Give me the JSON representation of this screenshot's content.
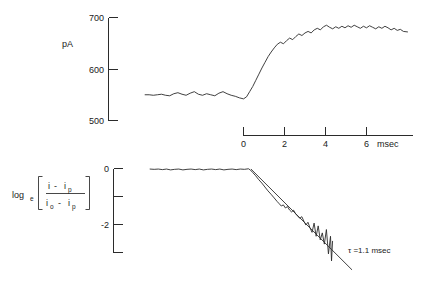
{
  "figure": {
    "background": "#ffffff",
    "ink_color": "#2b2b2b"
  },
  "chart_data": [
    {
      "type": "line",
      "id": "current-vs-time",
      "title": "",
      "xlabel": "msec",
      "ylabel": "pA",
      "xlim": [
        -4.8,
        8.2
      ],
      "ylim": [
        480,
        712
      ],
      "grid": false,
      "legend": null,
      "axis_ticks": {
        "y": [
          500,
          600,
          700
        ],
        "y_labels": [
          "500",
          "600",
          "700"
        ],
        "x": [
          0,
          2,
          4,
          6
        ],
        "x_labels": [
          "0",
          "2",
          "4",
          "6"
        ],
        "x_unit_label": "msec"
      },
      "series": [
        {
          "name": "membrane current",
          "x": [
            -4.8,
            -4.6,
            -4.4,
            -4.2,
            -4.0,
            -3.8,
            -3.6,
            -3.4,
            -3.2,
            -3.0,
            -2.8,
            -2.6,
            -2.4,
            -2.2,
            -2.0,
            -1.8,
            -1.6,
            -1.4,
            -1.2,
            -1.0,
            -0.8,
            -0.6,
            -0.4,
            -0.2,
            0.0,
            0.15,
            0.3,
            0.45,
            0.6,
            0.75,
            0.9,
            1.05,
            1.2,
            1.35,
            1.5,
            1.65,
            1.8,
            1.95,
            2.1,
            2.25,
            2.4,
            2.55,
            2.7,
            2.85,
            3.0,
            3.15,
            3.3,
            3.45,
            3.6,
            3.75,
            3.9,
            4.05,
            4.2,
            4.35,
            4.5,
            4.65,
            4.8,
            4.95,
            5.1,
            5.25,
            5.4,
            5.55,
            5.7,
            5.85,
            6.0,
            6.15,
            6.3,
            6.45,
            6.6,
            6.75,
            6.9,
            7.05,
            7.2,
            7.35,
            7.5,
            7.65,
            7.8,
            8.0
          ],
          "y": [
            550,
            550,
            549,
            550,
            551,
            549,
            548,
            552,
            554,
            551,
            549,
            553,
            556,
            551,
            549,
            552,
            550,
            548,
            553,
            556,
            552,
            549,
            547,
            544,
            542,
            546,
            556,
            566,
            578,
            590,
            602,
            613,
            624,
            633,
            641,
            648,
            652,
            649,
            655,
            660,
            657,
            663,
            668,
            665,
            670,
            673,
            670,
            676,
            679,
            676,
            682,
            685,
            681,
            678,
            682,
            679,
            683,
            680,
            684,
            681,
            685,
            682,
            679,
            683,
            680,
            684,
            681,
            678,
            682,
            679,
            683,
            680,
            676,
            679,
            675,
            677,
            673,
            672
          ]
        }
      ]
    },
    {
      "type": "line",
      "id": "semilog-decay",
      "title": "",
      "xlabel": "",
      "ylabel": "log_e[(i - i_p)/(i_o - i_p)]",
      "xlim": [
        -4.8,
        8.2
      ],
      "ylim": [
        -3.9,
        0.35
      ],
      "grid": false,
      "legend": null,
      "axis_ticks": {
        "y": [
          0,
          -1,
          -2,
          -3
        ],
        "y_labels": [
          "0",
          "",
          "-2",
          ""
        ]
      },
      "annotations": [
        {
          "text": "τ =1.1 msec",
          "x": 5.1,
          "y": -2.55
        }
      ],
      "series": [
        {
          "name": "log transformed current",
          "x": [
            -4.8,
            -4.6,
            -4.4,
            -4.2,
            -4.0,
            -3.8,
            -3.6,
            -3.4,
            -3.2,
            -3.0,
            -2.8,
            -2.6,
            -2.4,
            -2.2,
            -2.0,
            -1.8,
            -1.6,
            -1.4,
            -1.2,
            -1.0,
            -0.8,
            -0.6,
            -0.4,
            -0.2,
            0.0,
            0.1,
            0.2,
            0.35,
            0.5,
            0.65,
            0.8,
            0.95,
            1.1,
            1.25,
            1.4,
            1.5,
            1.6,
            1.7,
            1.8,
            1.9,
            2.0,
            2.1,
            2.2,
            2.3,
            2.4,
            2.5,
            2.6,
            2.7,
            2.8,
            2.9,
            3.0,
            3.1,
            3.2,
            3.3,
            3.4,
            3.5,
            3.6,
            3.7,
            3.8,
            3.9,
            4.0,
            4.05,
            4.1
          ],
          "y": [
            -0.02,
            -0.03,
            -0.02,
            -0.04,
            -0.02,
            -0.05,
            -0.03,
            -0.02,
            -0.05,
            -0.03,
            -0.02,
            -0.04,
            -0.02,
            -0.05,
            -0.03,
            -0.02,
            -0.04,
            -0.02,
            -0.05,
            -0.03,
            -0.02,
            -0.04,
            -0.02,
            -0.03,
            -0.01,
            -0.06,
            -0.14,
            -0.26,
            -0.4,
            -0.52,
            -0.66,
            -0.8,
            -0.92,
            -1.05,
            -1.18,
            -1.26,
            -1.34,
            -1.3,
            -1.41,
            -1.36,
            -1.48,
            -1.55,
            -1.49,
            -1.62,
            -1.7,
            -1.78,
            -1.72,
            -1.88,
            -2.02,
            -1.92,
            -2.12,
            -2.28,
            -1.95,
            -2.42,
            -2.05,
            -2.55,
            -2.3,
            -2.7,
            -2.18,
            -3.05,
            -2.42,
            -3.3,
            -2.6
          ]
        },
        {
          "name": "exponential fit line",
          "fit": true,
          "x": [
            0.12,
            5.05
          ],
          "y": [
            -0.02,
            -3.62
          ]
        }
      ]
    }
  ]
}
